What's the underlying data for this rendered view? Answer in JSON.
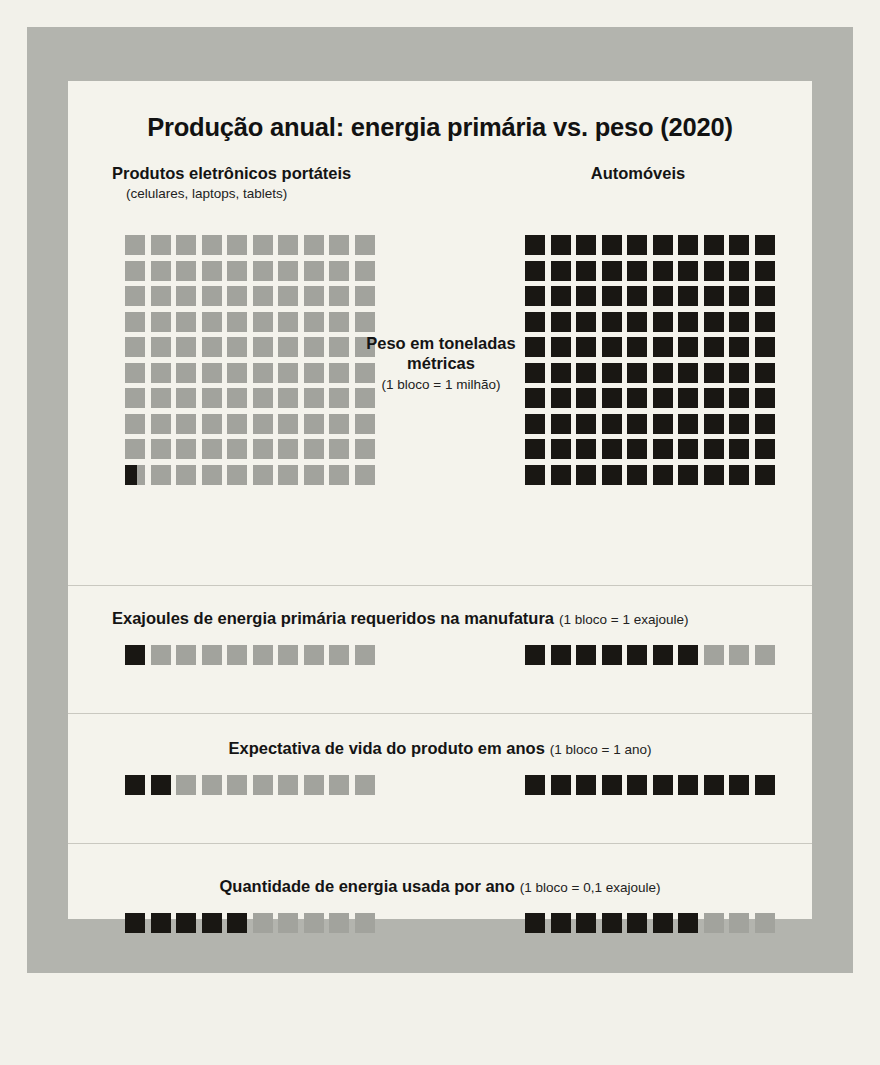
{
  "title": "Produção anual: energia primária vs. peso (2020)",
  "columns": {
    "left": {
      "title": "Produtos eletrônicos portáteis",
      "subtitle": "(celulares, laptops, tablets)"
    },
    "right": {
      "title": "Automóveis",
      "subtitle": ""
    }
  },
  "center_caption": {
    "main_line1": "Peso em toneladas",
    "main_line2": "métricas",
    "note": "(1 bloco = 1 milhão)"
  },
  "sections": {
    "energy_manufacture": {
      "label": "Exajoules de energia primária requeridos na manufatura",
      "note": "(1 bloco = 1 exajoule)"
    },
    "life_expectancy": {
      "label": "Expectativa de vida do produto em anos",
      "note": "(1 bloco = 1 ano)"
    },
    "energy_per_year": {
      "label": "Quantidade de energia usada por ano",
      "note": "(1 bloco = 0,1 exajoule)"
    }
  },
  "colors": {
    "dark_block": "#191713",
    "light_block": "#a2a39d",
    "panel_background": "#f4f3ec",
    "frame": "#b3b4ae",
    "page_background": "#f2f1ea",
    "divider": "#c9c8c0"
  },
  "chart_data": {
    "type": "pictogram",
    "title": "Produção anual: energia primária vs. peso (2020)",
    "categories": [
      "Produtos eletrônicos portáteis",
      "Automóveis"
    ],
    "grid_columns": 10,
    "metrics": [
      {
        "name": "Peso em toneladas métricas",
        "unit_label": "1 bloco = 1 milhão",
        "unit_value": 1000000,
        "total_blocks": 100,
        "series": [
          {
            "name": "Produtos eletrônicos portáteis",
            "filled_blocks": 0.6,
            "value": 600000
          },
          {
            "name": "Automóveis",
            "filled_blocks": 100,
            "value": 100000000
          }
        ]
      },
      {
        "name": "Exajoules de energia primária requeridos na manufatura",
        "unit_label": "1 bloco = 1 exajoule",
        "unit_value": 1,
        "total_blocks": 10,
        "series": [
          {
            "name": "Produtos eletrônicos portáteis",
            "filled_blocks": 1,
            "value": 1
          },
          {
            "name": "Automóveis",
            "filled_blocks": 7,
            "value": 7
          }
        ]
      },
      {
        "name": "Expectativa de vida do produto em anos",
        "unit_label": "1 bloco = 1 ano",
        "unit_value": 1,
        "total_blocks": 10,
        "series": [
          {
            "name": "Produtos eletrônicos portáteis",
            "filled_blocks": 2,
            "value": 2
          },
          {
            "name": "Automóveis",
            "filled_blocks": 10,
            "value": 10
          }
        ]
      },
      {
        "name": "Quantidade de energia usada por ano",
        "unit_label": "1 bloco = 0,1 exajoule",
        "unit_value": 0.1,
        "total_blocks": 10,
        "series": [
          {
            "name": "Produtos eletrônicos portáteis",
            "filled_blocks": 5,
            "value": 0.5
          },
          {
            "name": "Automóveis",
            "filled_blocks": 7,
            "value": 0.7
          }
        ]
      }
    ]
  }
}
